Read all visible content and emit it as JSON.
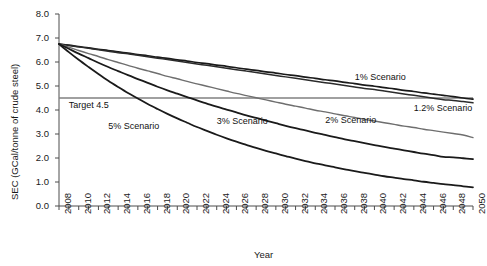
{
  "chart_data": {
    "type": "line",
    "title": "",
    "xlabel": "Year",
    "ylabel": "SEC (GCal/tonne of crude steel)",
    "xlim": [
      2008,
      2050
    ],
    "ylim": [
      0.0,
      8.0
    ],
    "grid": false,
    "legend_position": "inline-annotations",
    "ytick_labels": [
      "8.0",
      "7.0",
      "6.0",
      "5.0",
      "4.0",
      "3.0",
      "2.0",
      "1.0",
      "0.0"
    ],
    "ytick_values": [
      8.0,
      7.0,
      6.0,
      5.0,
      4.0,
      3.0,
      2.0,
      1.0,
      0.0
    ],
    "xtick_labels": [
      "2008",
      "2010",
      "2012",
      "2014",
      "2016",
      "2018",
      "2020",
      "2022",
      "2024",
      "2026",
      "2028",
      "2030",
      "2032",
      "2034",
      "2036",
      "2038",
      "2040",
      "2042",
      "2044",
      "2046",
      "2048",
      "2050"
    ],
    "xtick_values": [
      2008,
      2010,
      2012,
      2014,
      2016,
      2018,
      2020,
      2022,
      2024,
      2026,
      2028,
      2030,
      2032,
      2034,
      2036,
      2038,
      2040,
      2042,
      2044,
      2046,
      2048,
      2050
    ],
    "minor_xticks_every": 1,
    "x": [
      2008,
      2009,
      2010,
      2011,
      2012,
      2013,
      2014,
      2015,
      2016,
      2017,
      2018,
      2019,
      2020,
      2021,
      2022,
      2023,
      2024,
      2025,
      2026,
      2027,
      2028,
      2029,
      2030,
      2031,
      2032,
      2033,
      2034,
      2035,
      2036,
      2037,
      2038,
      2039,
      2040,
      2041,
      2042,
      2043,
      2044,
      2045,
      2046,
      2047,
      2048,
      2049,
      2050
    ],
    "start_value": 6.75,
    "series": [
      {
        "name": "1% Scenario",
        "label": "1% Scenario",
        "color": "#1a1a1a",
        "width": 1.7,
        "end_value": 4.45,
        "values": [
          6.75,
          6.7,
          6.64,
          6.59,
          6.53,
          6.48,
          6.42,
          6.37,
          6.31,
          6.26,
          6.2,
          6.15,
          6.09,
          6.04,
          5.98,
          5.93,
          5.87,
          5.82,
          5.76,
          5.7,
          5.65,
          5.59,
          5.54,
          5.48,
          5.43,
          5.37,
          5.32,
          5.26,
          5.21,
          5.15,
          5.1,
          5.04,
          4.99,
          4.93,
          4.88,
          4.82,
          4.77,
          4.71,
          4.66,
          4.61,
          4.56,
          4.5,
          4.45
        ]
      },
      {
        "name": "1.2% Scenario",
        "label": "1.2% Scenario",
        "color": "#2b2b2b",
        "width": 1.5,
        "end_value": 4.3,
        "values": [
          6.75,
          6.69,
          6.63,
          6.57,
          6.51,
          6.45,
          6.39,
          6.34,
          6.28,
          6.22,
          6.16,
          6.1,
          6.04,
          5.98,
          5.92,
          5.86,
          5.8,
          5.74,
          5.68,
          5.62,
          5.56,
          5.5,
          5.44,
          5.38,
          5.32,
          5.26,
          5.2,
          5.14,
          5.08,
          5.02,
          4.96,
          4.9,
          4.85,
          4.79,
          4.73,
          4.67,
          4.61,
          4.55,
          4.49,
          4.43,
          4.4,
          4.35,
          4.3
        ]
      },
      {
        "name": "2% Scenario",
        "label": "2% Scenario",
        "color": "#6e6e6e",
        "width": 1.4,
        "end_value": 2.85,
        "values": [
          6.75,
          6.62,
          6.48,
          6.35,
          6.23,
          6.1,
          5.98,
          5.86,
          5.74,
          5.63,
          5.52,
          5.4,
          5.3,
          5.19,
          5.09,
          4.99,
          4.89,
          4.79,
          4.69,
          4.6,
          4.51,
          4.42,
          4.33,
          4.24,
          4.16,
          4.08,
          3.99,
          3.92,
          3.84,
          3.76,
          3.69,
          3.61,
          3.54,
          3.47,
          3.4,
          3.33,
          3.27,
          3.2,
          3.14,
          3.08,
          3.02,
          2.96,
          2.85
        ]
      },
      {
        "name": "3% Scenario",
        "label": "3% Scenario",
        "color": "#1a1a1a",
        "width": 1.8,
        "end_value": 1.95,
        "values": [
          6.75,
          6.55,
          6.35,
          6.16,
          5.97,
          5.79,
          5.62,
          5.45,
          5.29,
          5.13,
          4.97,
          4.82,
          4.68,
          4.54,
          4.4,
          4.27,
          4.14,
          4.02,
          3.9,
          3.78,
          3.67,
          3.56,
          3.45,
          3.34,
          3.24,
          3.15,
          3.05,
          2.96,
          2.87,
          2.78,
          2.7,
          2.62,
          2.54,
          2.46,
          2.39,
          2.32,
          2.25,
          2.18,
          2.12,
          2.05,
          2.03,
          1.99,
          1.95
        ]
      },
      {
        "name": "5% Scenario",
        "label": "5% Scenario",
        "color": "#1a1a1a",
        "width": 1.8,
        "end_value": 0.78,
        "values": [
          6.75,
          6.41,
          6.09,
          5.79,
          5.5,
          5.22,
          4.96,
          4.71,
          4.48,
          4.25,
          4.04,
          3.84,
          3.65,
          3.47,
          3.29,
          3.13,
          2.97,
          2.82,
          2.68,
          2.55,
          2.42,
          2.3,
          2.19,
          2.08,
          1.97,
          1.87,
          1.78,
          1.69,
          1.61,
          1.53,
          1.45,
          1.38,
          1.31,
          1.24,
          1.18,
          1.12,
          1.07,
          1.01,
          0.96,
          0.91,
          0.87,
          0.82,
          0.78
        ]
      }
    ],
    "reference_lines": [
      {
        "name": "target-line",
        "label": "Target 4.5",
        "value": 4.5,
        "color": "#808080",
        "x_start": 2008,
        "x_end": 2050
      }
    ],
    "annotations": [
      {
        "text": "1% Scenario",
        "x": 2038,
        "y": 5.35
      },
      {
        "text": "1.2% Scenario",
        "x": 2044,
        "y": 4.05
      },
      {
        "text": "2% Scenario",
        "x": 2035,
        "y": 3.55
      },
      {
        "text": "3% Scenario",
        "x": 2024,
        "y": 3.5
      },
      {
        "text": "5% Scenario",
        "x": 2013,
        "y": 3.3
      },
      {
        "text": "Target 4.5",
        "x": 2009,
        "y": 4.15
      }
    ]
  }
}
